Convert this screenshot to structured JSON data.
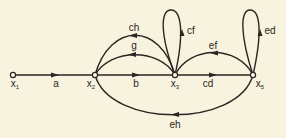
{
  "diagram": {
    "type": "signal-flow-graph",
    "nodes": [
      {
        "id": "x1",
        "label": "x",
        "sub": "1",
        "x": 13,
        "y": 75
      },
      {
        "id": "x2",
        "label": "x",
        "sub": "2",
        "x": 95,
        "y": 75
      },
      {
        "id": "x3",
        "label": "x",
        "sub": "3",
        "x": 175,
        "y": 75
      },
      {
        "id": "x5",
        "label": "x",
        "sub": "5",
        "x": 253,
        "y": 75
      }
    ],
    "edges": [
      {
        "from": "x1",
        "to": "x2",
        "gain": "a"
      },
      {
        "from": "x2",
        "to": "x3",
        "gain": "b"
      },
      {
        "from": "x3",
        "to": "x5",
        "gain": "cd"
      },
      {
        "from": "x3",
        "to": "x2",
        "gain": "g"
      },
      {
        "from": "x3",
        "to": "x2",
        "gain": "ch"
      },
      {
        "from": "x3",
        "to": "x3",
        "gain": "cf"
      },
      {
        "from": "x5",
        "to": "x3",
        "gain": "ef"
      },
      {
        "from": "x5",
        "to": "x5",
        "gain": "ed"
      },
      {
        "from": "x5",
        "to": "x2",
        "gain": "eh"
      }
    ],
    "labels": {
      "a": "a",
      "b": "b",
      "cd": "cd",
      "g": "g",
      "ch": "ch",
      "cf": "cf",
      "ef": "ef",
      "ed": "ed",
      "eh": "eh",
      "x": "x",
      "s1": "1",
      "s2": "2",
      "s3": "3",
      "s5": "5"
    },
    "colors": {
      "background": "#f7f3df",
      "stroke": "#2a2622"
    }
  }
}
